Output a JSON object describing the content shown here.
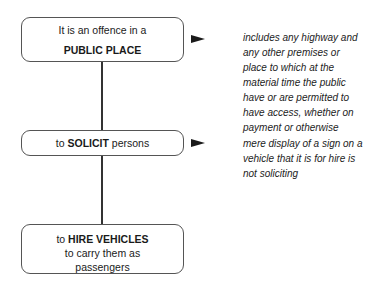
{
  "diagram": {
    "nodes": [
      {
        "id": "public-place",
        "line1": "It is an offence in a",
        "line2": "PUBLIC PLACE"
      },
      {
        "id": "solicit",
        "prefix": "to ",
        "bold": "SOLICIT",
        "suffix": " persons"
      },
      {
        "id": "hire-vehicles",
        "prefix": "to ",
        "bold": "HIRE VEHICLES",
        "line2": "to carry them as",
        "line3": "passengers"
      }
    ],
    "notes": [
      {
        "for": "public-place",
        "text": "includes any highway and any other premises or place to which at the material time the public have or are permitted to have access, whether on payment or otherwise",
        "lines": [
          "includes any highway and",
          "any other premises or",
          "place to which at the",
          "material time the public",
          "have or are permitted to",
          "have access, whether on",
          "payment or otherwise"
        ]
      },
      {
        "for": "solicit",
        "text": "mere display of a sign on a vehicle that it is for hire is not soliciting",
        "lines": [
          "mere display of a sign on a",
          "vehicle that it is for hire is",
          "not soliciting"
        ]
      }
    ]
  }
}
